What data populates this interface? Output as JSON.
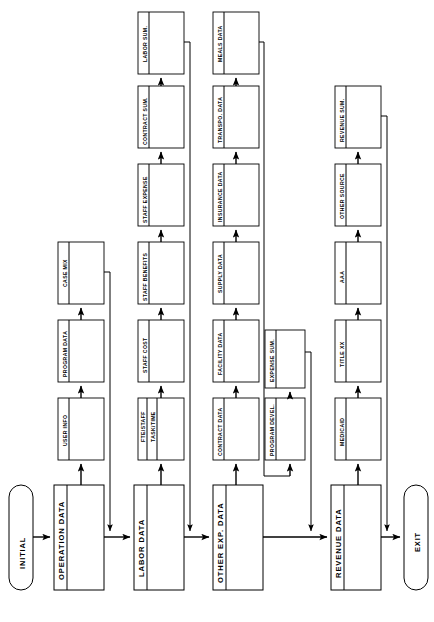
{
  "diagram": {
    "orientation": "rotated-90",
    "terminators": {
      "start": "INITIAL",
      "end": "EXIT"
    },
    "main_blocks": [
      {
        "id": "operation-data",
        "label": "OPERATION DATA"
      },
      {
        "id": "labor-data",
        "label": "LABOR DATA"
      },
      {
        "id": "other-exp-data",
        "label": "OTHER EXP. DATA"
      },
      {
        "id": "revenue-data",
        "label": "REVENUE DATA"
      }
    ],
    "rows": [
      {
        "id": "operation-row",
        "parent": "OPERATION DATA",
        "steps": [
          {
            "id": "user-info",
            "label": "USER INFO"
          },
          {
            "id": "program-data",
            "label": "PROGRAM DATA"
          },
          {
            "id": "case-mix",
            "label": "CASE MIX"
          }
        ]
      },
      {
        "id": "labor-row",
        "parent": "LABOR DATA",
        "steps": [
          {
            "id": "fte-staff",
            "label": "FTE/STAFF",
            "label2": "TASK/TIME"
          },
          {
            "id": "staff-cost",
            "label": "STAFF COST"
          },
          {
            "id": "staff-benefits",
            "label": "STAFF BENEFITS"
          },
          {
            "id": "staff-expense",
            "label": "STAFF EXPENSE"
          },
          {
            "id": "contract-sum",
            "label": "CONTRACT SUM."
          },
          {
            "id": "labor-sum",
            "label": "LABOR SUM."
          }
        ]
      },
      {
        "id": "other-exp-row",
        "parent": "OTHER EXP. DATA",
        "steps": [
          {
            "id": "contract-data",
            "label": "CONTRACT DATA"
          },
          {
            "id": "facility-data",
            "label": "FACILITY DATA"
          },
          {
            "id": "supply-data",
            "label": "SUPPLY DATA"
          },
          {
            "id": "insurance-data",
            "label": "INSURANCE DATA"
          },
          {
            "id": "transpo-data",
            "label": "TRANSPO. DATA"
          },
          {
            "id": "meals-data",
            "label": "MEALS DATA"
          }
        ]
      },
      {
        "id": "expense-branch-row",
        "parent": "OTHER EXP. DATA",
        "steps": [
          {
            "id": "program-devel",
            "label": "PROGRAM DEVEL."
          },
          {
            "id": "expense-sum",
            "label": "EXPENSE SUM."
          }
        ]
      },
      {
        "id": "revenue-row",
        "parent": "REVENUE DATA",
        "steps": [
          {
            "id": "medicaid",
            "label": "MEDICAID"
          },
          {
            "id": "title-xx",
            "label": "TITLE XX"
          },
          {
            "id": "aaa",
            "label": "AAA"
          },
          {
            "id": "other-source",
            "label": "OTHER SOURCE"
          },
          {
            "id": "revenue-sum",
            "label": "REVENUE SUM."
          }
        ]
      }
    ],
    "colors": {
      "stroke": "#000000",
      "fill": "#ffffff",
      "background": "#ffffff"
    }
  }
}
